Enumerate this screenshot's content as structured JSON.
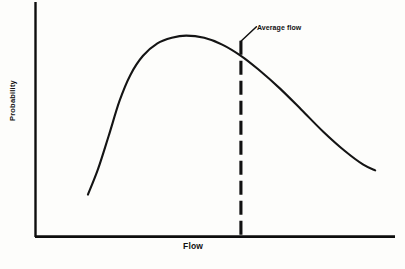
{
  "chart_data": {
    "type": "line",
    "title": "",
    "subtitle": "",
    "xlabel": "Flow",
    "ylabel": "Probability",
    "grid": false,
    "legend": null,
    "axis_ticks": {
      "x": [],
      "y": []
    },
    "xlim": [
      0,
      1
    ],
    "ylim": [
      0,
      1
    ],
    "series": [
      {
        "name": "Probability density of flow",
        "description": "Right-skewed probability distribution curve",
        "points": [
          {
            "x": 0.147,
            "y": 0.187
          },
          {
            "x": 0.175,
            "y": 0.3
          },
          {
            "x": 0.205,
            "y": 0.45
          },
          {
            "x": 0.235,
            "y": 0.605
          },
          {
            "x": 0.265,
            "y": 0.72
          },
          {
            "x": 0.3,
            "y": 0.805
          },
          {
            "x": 0.34,
            "y": 0.86
          },
          {
            "x": 0.38,
            "y": 0.885
          },
          {
            "x": 0.42,
            "y": 0.895
          },
          {
            "x": 0.47,
            "y": 0.885
          },
          {
            "x": 0.52,
            "y": 0.855
          },
          {
            "x": 0.572,
            "y": 0.805
          },
          {
            "x": 0.62,
            "y": 0.745
          },
          {
            "x": 0.68,
            "y": 0.66
          },
          {
            "x": 0.74,
            "y": 0.565
          },
          {
            "x": 0.8,
            "y": 0.468
          },
          {
            "x": 0.86,
            "y": 0.382
          },
          {
            "x": 0.912,
            "y": 0.32
          },
          {
            "x": 0.945,
            "y": 0.295
          }
        ]
      }
    ],
    "annotations": [
      {
        "name": "average-flow",
        "label": "Average flow",
        "type": "vertical-dashed-line-with-leader",
        "x": 0.572,
        "y_top": 0.872,
        "y_bottom": 0.0,
        "note": "Average flow lies to the right of the modal (most probable) flow"
      }
    ]
  },
  "colors": {
    "ink": "#111111",
    "background": "#fdfdfb",
    "curve": "#141414",
    "axis": "#0d0d0d"
  }
}
